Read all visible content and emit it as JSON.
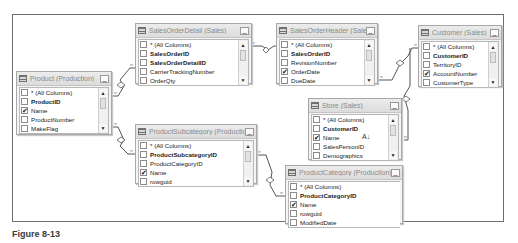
{
  "caption": "Figure 8-13",
  "tables": [
    {
      "title": "Product (Production)",
      "columns": [
        {
          "name": "* (All Columns)",
          "key": false,
          "checked": false
        },
        {
          "name": "ProductID",
          "key": true,
          "checked": false
        },
        {
          "name": "Name",
          "key": false,
          "checked": true
        },
        {
          "name": "ProductNumber",
          "key": false,
          "checked": false
        },
        {
          "name": "MakeFlag",
          "key": false,
          "checked": false
        }
      ]
    },
    {
      "title": "SalesOrderDetail (Sales)",
      "columns": [
        {
          "name": "* (All Columns)",
          "key": false,
          "checked": false
        },
        {
          "name": "SalesOrderID",
          "key": true,
          "checked": false
        },
        {
          "name": "SalesOrderDetailID",
          "key": true,
          "checked": false
        },
        {
          "name": "CarrierTrackingNumber",
          "key": false,
          "checked": false
        },
        {
          "name": "OrderQty",
          "key": false,
          "checked": false
        }
      ]
    },
    {
      "title": "SalesOrderHeader (Sales)",
      "columns": [
        {
          "name": "* (All Columns)",
          "key": false,
          "checked": false
        },
        {
          "name": "SalesOrderID",
          "key": true,
          "checked": false
        },
        {
          "name": "RevisionNumber",
          "key": false,
          "checked": false
        },
        {
          "name": "OrderDate",
          "key": false,
          "checked": true
        },
        {
          "name": "DueDate",
          "key": false,
          "checked": false
        }
      ]
    },
    {
      "title": "Customer (Sales)",
      "columns": [
        {
          "name": "* (All Columns)",
          "key": false,
          "checked": false
        },
        {
          "name": "CustomerID",
          "key": true,
          "checked": false
        },
        {
          "name": "TerritoryID",
          "key": false,
          "checked": false
        },
        {
          "name": "AccountNumber",
          "key": false,
          "checked": true
        },
        {
          "name": "CustomerType",
          "key": false,
          "checked": false
        }
      ]
    },
    {
      "title": "Store (Sales)",
      "columns": [
        {
          "name": "* (All Columns)",
          "key": false,
          "checked": false
        },
        {
          "name": "CustomerID",
          "key": true,
          "checked": false
        },
        {
          "name": "Name",
          "key": false,
          "checked": true
        },
        {
          "name": "SalesPersonID",
          "key": false,
          "checked": false
        },
        {
          "name": "Demographics",
          "key": false,
          "checked": false
        }
      ]
    },
    {
      "title": "ProductSubcategory (Production)",
      "columns": [
        {
          "name": "* (All Columns)",
          "key": false,
          "checked": false
        },
        {
          "name": "ProductSubcategoryID",
          "key": true,
          "checked": false
        },
        {
          "name": "ProductCategoryID",
          "key": false,
          "checked": false
        },
        {
          "name": "Name",
          "key": false,
          "checked": true
        },
        {
          "name": "rowguid",
          "key": false,
          "checked": false
        }
      ]
    },
    {
      "title": "ProductCategory (Production)",
      "columns": [
        {
          "name": "* (All Columns)",
          "key": false,
          "checked": false
        },
        {
          "name": "ProductCategoryID",
          "key": true,
          "checked": false
        },
        {
          "name": "Name",
          "key": false,
          "checked": true
        },
        {
          "name": "rowguid",
          "key": false,
          "checked": false
        },
        {
          "name": "ModifiedDate",
          "key": false,
          "checked": false
        }
      ]
    }
  ],
  "glyphs": {
    "check": "✔",
    "minimize": "_",
    "scroll_up": "▲",
    "scroll_down": "▼",
    "sort": "A↓"
  }
}
